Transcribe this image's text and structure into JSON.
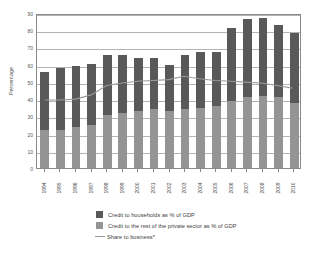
{
  "chart_data": {
    "type": "bar",
    "title": "",
    "subtitle": "",
    "xlabel": "",
    "ylabel": "Percentage",
    "ylim": [
      0,
      90
    ],
    "ytick_step": 10,
    "yticks": [
      0,
      10,
      20,
      30,
      40,
      50,
      60,
      70,
      80,
      90
    ],
    "grid": true,
    "stacked": true,
    "legend_position": "bottom",
    "categories": [
      "1994",
      "1995",
      "1996",
      "1997",
      "1998",
      "1999",
      "2000",
      "2001",
      "2002",
      "2003",
      "2004",
      "2005",
      "2006",
      "2007",
      "2008",
      "2009",
      "2010"
    ],
    "series": [
      {
        "name": "Credit to households as % of GDP",
        "type": "bar",
        "stack": "total",
        "color": "#595959",
        "values": [
          34.0,
          36.0,
          35.5,
          35.5,
          34.5,
          33.5,
          31.0,
          30.0,
          27.0,
          31.0,
          32.5,
          31.5,
          42.5,
          45.5,
          45.0,
          42.0,
          41.0
        ]
      },
      {
        "name": "Credit to the rest of the private sector as  % of GDP",
        "type": "bar",
        "stack": "total",
        "color": "#949494",
        "values": [
          22.0,
          22.0,
          24.0,
          25.0,
          31.0,
          32.0,
          33.0,
          34.0,
          33.0,
          34.5,
          35.0,
          36.0,
          39.0,
          41.0,
          42.0,
          41.0,
          37.5
        ]
      },
      {
        "name": "Share to business*",
        "type": "line",
        "color": "#9a9a9a",
        "values": [
          40.0,
          40.0,
          40.5,
          43.0,
          48.5,
          50.0,
          51.0,
          51.5,
          52.0,
          54.0,
          52.5,
          51.5,
          51.0,
          50.5,
          50.0,
          48.5,
          47.0
        ]
      }
    ],
    "bar_totals": [
      56.0,
      58.0,
      59.5,
      60.5,
      65.5,
      65.5,
      64.0,
      64.0,
      60.0,
      65.5,
      67.5,
      67.5,
      81.5,
      86.5,
      87.0,
      83.0,
      78.5
    ],
    "legend": [
      {
        "label": "Credit to households as % of GDP",
        "marker": "square",
        "color": "#595959"
      },
      {
        "label": "Credit to the rest of the private sector as  % of GDP",
        "marker": "square",
        "color": "#949494"
      },
      {
        "label": "Share to business*",
        "marker": "line",
        "color": "#9a9a9a"
      }
    ]
  }
}
